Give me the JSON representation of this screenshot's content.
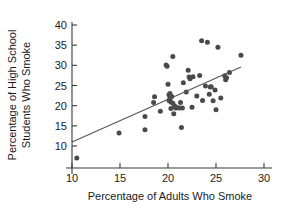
{
  "chart_data": {
    "type": "scatter",
    "title": "",
    "xlabel": "Percentage of Adults Who Smoke",
    "ylabel": "Percentage of High School Students Who Smoke",
    "ylabel_line1": "Percentage of High School",
    "ylabel_line2": "Students Who Smoke",
    "xlim": [
      8.5,
      31
    ],
    "ylim": [
      5,
      41
    ],
    "xticks": [
      10,
      15,
      20,
      25,
      30
    ],
    "yticks": [
      10,
      15,
      20,
      25,
      30,
      35,
      40
    ],
    "xtick_labels": [
      "10",
      "15",
      "20",
      "25",
      "30"
    ],
    "ytick_labels": [
      "10",
      "15",
      "20",
      "25",
      "30",
      "35",
      "40"
    ],
    "grid": false,
    "legend": "none",
    "point_color": "#4a4a4a",
    "line_color": "#555555",
    "axis_color": "#3a3a3a",
    "points": [
      [
        10.5,
        7.0
      ],
      [
        14.9,
        13.2
      ],
      [
        17.6,
        14.0
      ],
      [
        17.6,
        17.3
      ],
      [
        18.5,
        20.8
      ],
      [
        18.6,
        22.2
      ],
      [
        19.2,
        18.6
      ],
      [
        19.8,
        30.1
      ],
      [
        19.9,
        29.8
      ],
      [
        20.0,
        25.3
      ],
      [
        20.1,
        22.7
      ],
      [
        20.1,
        21.3
      ],
      [
        20.2,
        23.0
      ],
      [
        20.2,
        21.8
      ],
      [
        20.3,
        20.9
      ],
      [
        20.3,
        19.3
      ],
      [
        20.4,
        22.3
      ],
      [
        20.5,
        32.2
      ],
      [
        20.5,
        20.6
      ],
      [
        20.6,
        18.0
      ],
      [
        20.7,
        19.9
      ],
      [
        20.8,
        19.4
      ],
      [
        21.0,
        19.5
      ],
      [
        21.2,
        19.4
      ],
      [
        21.3,
        20.8
      ],
      [
        21.4,
        14.6
      ],
      [
        21.5,
        19.4
      ],
      [
        21.6,
        25.7
      ],
      [
        21.9,
        23.4
      ],
      [
        22.1,
        28.8
      ],
      [
        22.2,
        27.1
      ],
      [
        22.3,
        26.7
      ],
      [
        22.5,
        19.6
      ],
      [
        22.6,
        27.2
      ],
      [
        23.0,
        22.4
      ],
      [
        23.3,
        27.5
      ],
      [
        23.5,
        36.1
      ],
      [
        23.6,
        21.3
      ],
      [
        23.9,
        24.9
      ],
      [
        24.1,
        35.7
      ],
      [
        24.3,
        22.8
      ],
      [
        24.4,
        24.6
      ],
      [
        24.5,
        24.7
      ],
      [
        24.7,
        21.2
      ],
      [
        24.9,
        23.9
      ],
      [
        25.0,
        19.0
      ],
      [
        25.2,
        34.5
      ],
      [
        25.5,
        21.9
      ],
      [
        25.9,
        27.4
      ],
      [
        26.0,
        26.4
      ],
      [
        26.1,
        26.9
      ],
      [
        26.4,
        28.2
      ],
      [
        27.6,
        32.5
      ]
    ],
    "fit_line": {
      "x_start": 10.0,
      "y_start": 11.0,
      "x_end": 27.6,
      "y_end": 29.6
    }
  }
}
